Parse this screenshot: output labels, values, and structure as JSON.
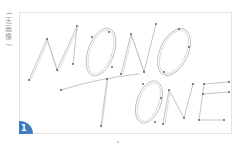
{
  "side_label": {
    "open": "(",
    "chars": [
      "无",
      "画",
      "像"
    ],
    "close": ")"
  },
  "artwork": {
    "word_top": "MONO",
    "word_bottom": "TONE",
    "stroke_color": "#b8b8b8",
    "node_color": "#555555"
  },
  "badge": {
    "number": "1",
    "color": "#3d7cc0"
  },
  "frame": {
    "border_color": "#e4e4e4"
  }
}
